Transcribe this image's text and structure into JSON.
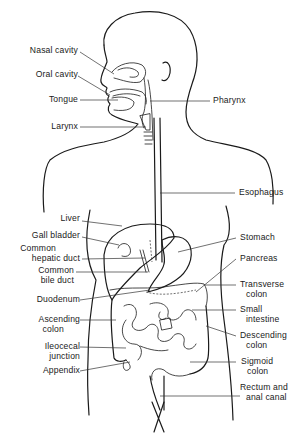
{
  "diagram": {
    "labels_left": [
      {
        "id": "nasal-cavity",
        "lines": [
          "Nasal cavity"
        ]
      },
      {
        "id": "oral-cavity",
        "lines": [
          "Oral cavity"
        ]
      },
      {
        "id": "tongue",
        "lines": [
          "Tongue"
        ]
      },
      {
        "id": "larynx",
        "lines": [
          "Larynx"
        ]
      },
      {
        "id": "liver",
        "lines": [
          "Liver"
        ]
      },
      {
        "id": "gall-bladder",
        "lines": [
          "Gall bladder"
        ]
      },
      {
        "id": "common-hepatic-duct",
        "lines": [
          "Common",
          "hepatic duct"
        ]
      },
      {
        "id": "common-bile-duct",
        "lines": [
          "Common",
          "bile duct"
        ]
      },
      {
        "id": "duodenum",
        "lines": [
          "Duodenum"
        ]
      },
      {
        "id": "ascending-colon",
        "lines": [
          "Ascending",
          "colon"
        ]
      },
      {
        "id": "ileocecal-junction",
        "lines": [
          "Ileocecal",
          "junction"
        ]
      },
      {
        "id": "appendix",
        "lines": [
          "Appendix"
        ]
      }
    ],
    "labels_right": [
      {
        "id": "pharynx",
        "lines": [
          "Pharynx"
        ]
      },
      {
        "id": "esophagus",
        "lines": [
          "Esophagus"
        ]
      },
      {
        "id": "stomach",
        "lines": [
          "Stomach"
        ]
      },
      {
        "id": "pancreas",
        "lines": [
          "Pancreas"
        ]
      },
      {
        "id": "transverse-colon",
        "lines": [
          "Transverse",
          "colon"
        ]
      },
      {
        "id": "small-intestine",
        "lines": [
          "Small",
          "intestine"
        ]
      },
      {
        "id": "descending-colon",
        "lines": [
          "Descending",
          "colon"
        ]
      },
      {
        "id": "sigmoid-colon",
        "lines": [
          "Sigmoid",
          "colon"
        ]
      },
      {
        "id": "rectum-anal-canal",
        "lines": [
          "Rectum and",
          "anal canal"
        ]
      }
    ]
  }
}
